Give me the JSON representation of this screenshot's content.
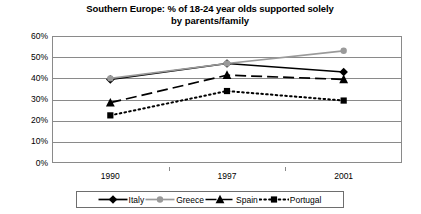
{
  "chart_data": {
    "type": "line",
    "title": "Southern Europe: % of 18-24 year olds supported solely by parents/family",
    "title_line1": "Southern Europe: % of 18-24 year olds supported solely",
    "title_line2": "by parents/family",
    "xlabel": "",
    "ylabel": "",
    "categories": [
      "1990",
      "1997",
      "2001"
    ],
    "x": [
      1990,
      1997,
      2001
    ],
    "ylim": [
      0,
      60
    ],
    "ytick_values": [
      0,
      10,
      20,
      30,
      40,
      50,
      60
    ],
    "ytick_labels": [
      "0%",
      "10%",
      "20%",
      "30%",
      "40%",
      "50%",
      "60%"
    ],
    "grid": true,
    "legend_position": "bottom",
    "series": [
      {
        "name": "Italy",
        "values": [
          39.5,
          47,
          43
        ],
        "marker": "diamond",
        "line_style": "solid",
        "color": "#000000"
      },
      {
        "name": "Greece",
        "values": [
          40,
          47,
          53
        ],
        "marker": "circle",
        "line_style": "solid",
        "color": "#9a9a9a"
      },
      {
        "name": "Spain",
        "values": [
          28.5,
          41.5,
          39.5
        ],
        "marker": "triangle",
        "line_style": "dashed",
        "color": "#000000"
      },
      {
        "name": "Portugal",
        "values": [
          22.5,
          34,
          29.5
        ],
        "marker": "square",
        "line_style": "dotted",
        "color": "#000000"
      }
    ]
  },
  "legend": {
    "items": [
      {
        "label": "Italy",
        "marker": "diamond-icon",
        "color": "#000000"
      },
      {
        "label": "Greece",
        "marker": "circle-icon",
        "color": "#9a9a9a"
      },
      {
        "label": "Spain",
        "marker": "triangle-icon",
        "color": "#000000"
      },
      {
        "label": "Portugal",
        "marker": "square-icon",
        "color": "#000000"
      }
    ]
  },
  "colors": {
    "axis": "#8a8a8a",
    "grid": "#8a8a8a",
    "text": "#000000",
    "background": "#ffffff",
    "greece": "#9a9a9a",
    "series_black": "#000000"
  }
}
